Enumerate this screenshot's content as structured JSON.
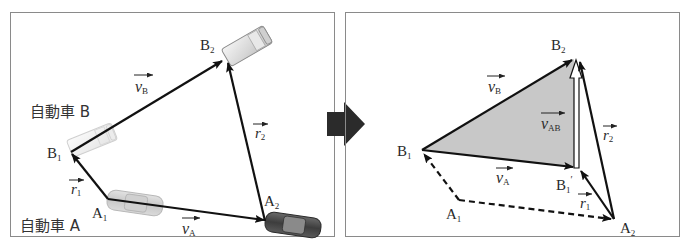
{
  "left_panel": {
    "car_a_label": "自動車 A",
    "car_b_label": "自動車 B",
    "points": {
      "A1": {
        "base": "A",
        "sub": "1"
      },
      "A2": {
        "base": "A",
        "sub": "2"
      },
      "B1": {
        "base": "B",
        "sub": "1"
      },
      "B2": {
        "base": "B",
        "sub": "2"
      }
    },
    "vectors": {
      "vA": {
        "base": "v",
        "sub": "A"
      },
      "vB": {
        "base": "v",
        "sub": "B"
      },
      "r1": {
        "base": "r",
        "sub": "1"
      },
      "r2": {
        "base": "r",
        "sub": "2"
      }
    }
  },
  "transition_arrow": {
    "icon": "right-arrow-icon",
    "color": "#2b2b2b"
  },
  "right_panel": {
    "points": {
      "A1": {
        "base": "A",
        "sub": "1"
      },
      "A2": {
        "base": "A",
        "sub": "2"
      },
      "B1": {
        "base": "B",
        "sub": "1"
      },
      "B2": {
        "base": "B",
        "sub": "2"
      },
      "B1prime": {
        "base": "B",
        "sub": "1",
        "prime": "′"
      }
    },
    "vectors": {
      "vA": {
        "base": "v",
        "sub": "A"
      },
      "vB": {
        "base": "v",
        "sub": "B"
      },
      "vAB": {
        "base": "v",
        "sub": "AB"
      },
      "r1": {
        "base": "r",
        "sub": "1"
      },
      "r2": {
        "base": "r",
        "sub": "2"
      }
    },
    "fill_color": "#c8c8c8"
  },
  "colors": {
    "frame": "#8a8a8a",
    "line": "#111111"
  }
}
